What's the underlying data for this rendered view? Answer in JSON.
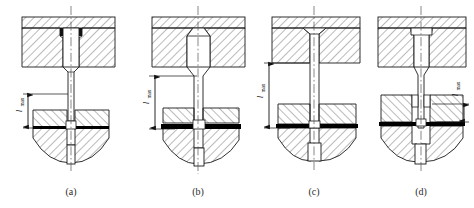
{
  "figure": {
    "background_color": "#ffffff",
    "line_color": "#1a1a1a",
    "hatch_color": "#3a3a3a",
    "workpiece_color": "#000000",
    "centerline_color": "#555555"
  },
  "panels": [
    {
      "id": "a",
      "caption": "(a)",
      "dimension_label": "l",
      "dimension_subscript": "max",
      "dimension_side": "left",
      "dimension_span_px": 34,
      "punch_head": "straight-shoulder",
      "description": "Punch with cylindrical head seated in counterbore of die plate; stepped shank; short unsupported length"
    },
    {
      "id": "b",
      "caption": "(b)",
      "dimension_label": "l",
      "dimension_subscript": "max",
      "dimension_side": "left",
      "dimension_span_px": 55,
      "punch_head": "chamfered-shoulder",
      "description": "Punch with chamfered head; long slender shank; thick workpiece; larger unsupported length"
    },
    {
      "id": "c",
      "caption": "(c)",
      "dimension_label": "l",
      "dimension_subscript": "max",
      "dimension_side": "left",
      "dimension_span_px": 66,
      "punch_head": "conical-countersunk",
      "description": "Punch with countersunk conical head; slender parallel shank; greatest unsupported length"
    },
    {
      "id": "d",
      "caption": "(d)",
      "dimension_label": "l",
      "dimension_subscript": "max",
      "dimension_side": "right",
      "dimension_span_px": 20,
      "punch_head": "straight-shoulder",
      "description": "Punch guided by bushing in lower die plate; shortest unsupported length"
    }
  ],
  "legend": {
    "upper_plate": "Upper die plate (punch holder)",
    "punch": "Punch",
    "workpiece": "Sheet-metal workpiece",
    "lower_die": "Lower die block",
    "centerline": "Axis centerline",
    "dimension": "Maximum unsupported punch length"
  }
}
